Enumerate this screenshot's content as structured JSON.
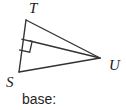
{
  "figure": {
    "kind": "geometry-triangle-diagram",
    "stroke_color": "#333333",
    "background_color": "#ffffff",
    "vertices": [
      {
        "id": "T",
        "label": "T",
        "x": 26,
        "y": 20
      },
      {
        "id": "S",
        "label": "S",
        "x": 19,
        "y": 72
      },
      {
        "id": "U",
        "label": "U",
        "x": 100,
        "y": 58
      }
    ],
    "sides": [
      {
        "from": "S",
        "to": "T"
      },
      {
        "from": "T",
        "to": "U"
      },
      {
        "from": "S",
        "to": "U"
      }
    ],
    "cevian": {
      "from": "U",
      "to_point_on": "ST",
      "foot": {
        "x": 30,
        "y": 41
      }
    },
    "right_angle_marker": {
      "at": {
        "x": 30,
        "y": 41
      },
      "vertex_label": "right-angle-at-foot-of-altitude",
      "size": 12
    }
  },
  "labels": {
    "T": "T",
    "S": "S",
    "U": "U"
  },
  "caption": {
    "base_prompt": "base:"
  }
}
